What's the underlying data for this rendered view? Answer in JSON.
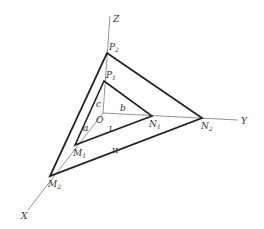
{
  "diagram": {
    "axes": [
      {
        "name": "Z",
        "label": "Z"
      },
      {
        "name": "Y",
        "label": "Y"
      },
      {
        "name": "X",
        "label": "X"
      }
    ],
    "origin": {
      "label": "O"
    },
    "points": {
      "P1": {
        "base": "P",
        "sub": "1"
      },
      "P2": {
        "base": "P",
        "sub": "2"
      },
      "N1": {
        "base": "N",
        "sub": "1"
      },
      "N2": {
        "base": "N",
        "sub": "2"
      },
      "M1": {
        "base": "M",
        "sub": "1"
      },
      "M2": {
        "base": "M",
        "sub": "2"
      }
    },
    "intercepts": {
      "a": "a",
      "b": "b",
      "c": "c"
    },
    "triangles": {
      "inner": "I",
      "outer": "II"
    }
  }
}
